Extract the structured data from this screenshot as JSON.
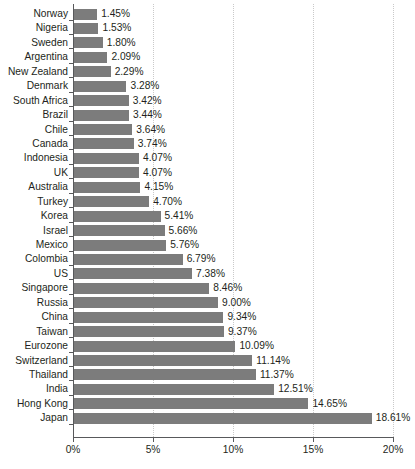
{
  "chart_data": {
    "type": "bar",
    "orientation": "horizontal",
    "title": "",
    "subtitle": "",
    "xlabel": "",
    "ylabel": "",
    "xlim": [
      0,
      20
    ],
    "ylim": null,
    "xticks": [
      0,
      5,
      10,
      15,
      20
    ],
    "xtick_labels": [
      "0%",
      "5%",
      "10%",
      "15%",
      "20%"
    ],
    "grid": "vertical-dotted",
    "legend": null,
    "value_label_suffix": "%",
    "bar_color": "#7c7c7c",
    "axis_color": "#58595b",
    "grid_color": "#c9c9c9",
    "text_color": "#231f20",
    "categories": [
      "Norway",
      "Nigeria",
      "Sweden",
      "Argentina",
      "New Zealand",
      "Denmark",
      "South Africa",
      "Brazil",
      "Chile",
      "Canada",
      "Indonesia",
      "UK",
      "Australia",
      "Turkey",
      "Korea",
      "Israel",
      "Mexico",
      "Colombia",
      "US",
      "Singapore",
      "Russia",
      "China",
      "Taiwan",
      "Eurozone",
      "Switzerland",
      "Thailand",
      "India",
      "Hong Kong",
      "Japan"
    ],
    "values": [
      1.45,
      1.53,
      1.8,
      2.09,
      2.29,
      3.28,
      3.42,
      3.44,
      3.64,
      3.74,
      4.07,
      4.07,
      4.15,
      4.7,
      5.41,
      5.66,
      5.76,
      6.79,
      7.38,
      8.46,
      9.0,
      9.34,
      9.37,
      10.09,
      11.14,
      11.37,
      12.51,
      14.65,
      18.61
    ],
    "value_labels": [
      "1.45%",
      "1.53%",
      "1.80%",
      "2.09%",
      "2.29%",
      "3.28%",
      "3.42%",
      "3.44%",
      "3.64%",
      "3.74%",
      "4.07%",
      "4.07%",
      "4.15%",
      "4.70%",
      "5.41%",
      "5.66%",
      "5.76%",
      "6.79%",
      "7.38%",
      "8.46%",
      "9.00%",
      "9.34%",
      "9.37%",
      "10.09%",
      "11.14%",
      "11.37%",
      "12.51%",
      "14.65%",
      "18.61%"
    ]
  }
}
